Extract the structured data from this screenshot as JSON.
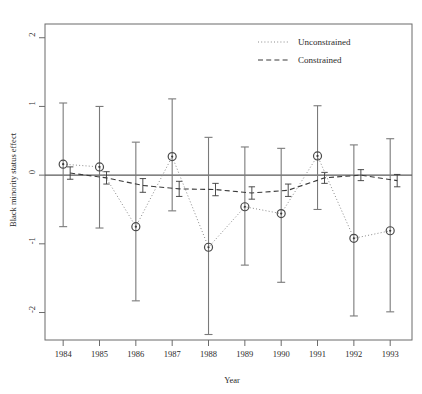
{
  "chart_data": {
    "type": "line",
    "title": "",
    "xlabel": "Year",
    "ylabel": "Black minority status effect",
    "x": [
      1984,
      1985,
      1986,
      1987,
      1988,
      1989,
      1990,
      1991,
      1992,
      1993
    ],
    "categories": [
      "1984",
      "1985",
      "1986",
      "1987",
      "1988",
      "1989",
      "1990",
      "1991",
      "1992",
      "1993"
    ],
    "xtick_labels": [
      "1984",
      "1985",
      "1986",
      "1987",
      "1988",
      "1989",
      "1990",
      "1991",
      "1992",
      "1993"
    ],
    "ytick_labels": [
      "2",
      "1",
      "0",
      "-1",
      "-2"
    ],
    "ytick_values": [
      2,
      1,
      0,
      -1,
      -2
    ],
    "ylim": [
      -2.4,
      2.2
    ],
    "xlim": [
      1983.5,
      1993.6
    ],
    "grid": false,
    "zero_reference_line": 0,
    "legend_position": "top-right",
    "series": [
      {
        "name": "Unconstrained",
        "style": "dotted",
        "marker": "open-circle",
        "values": [
          0.16,
          0.12,
          -0.75,
          0.27,
          -1.05,
          -0.46,
          -0.56,
          0.28,
          -0.92,
          -0.81
        ],
        "ci_lower": [
          -0.75,
          -0.77,
          -1.83,
          -0.52,
          -2.32,
          -1.31,
          -1.56,
          -0.5,
          -2.05,
          -1.99
        ],
        "ci_upper": [
          1.05,
          1.0,
          0.48,
          1.11,
          0.55,
          0.41,
          0.39,
          1.01,
          0.44,
          0.53
        ]
      },
      {
        "name": "Constrained",
        "style": "dashed",
        "marker": "error-bar",
        "values": [
          0.03,
          -0.04,
          -0.15,
          -0.2,
          -0.21,
          -0.26,
          -0.22,
          -0.04,
          0.0,
          -0.08
        ],
        "ci_lower": [
          -0.06,
          -0.13,
          -0.25,
          -0.31,
          -0.3,
          -0.35,
          -0.31,
          -0.12,
          -0.08,
          -0.17
        ],
        "ci_upper": [
          0.12,
          0.05,
          -0.05,
          -0.09,
          -0.12,
          -0.17,
          -0.13,
          0.04,
          0.08,
          0.01
        ]
      }
    ],
    "legend": [
      {
        "label": "Unconstrained",
        "style": "dotted"
      },
      {
        "label": "Constrained",
        "style": "dashed"
      }
    ]
  },
  "axes": {
    "y_title": "Black minority status effect",
    "x_title": "Year"
  },
  "legend": {
    "items": [
      {
        "label": "Unconstrained"
      },
      {
        "label": "Constrained"
      }
    ]
  }
}
